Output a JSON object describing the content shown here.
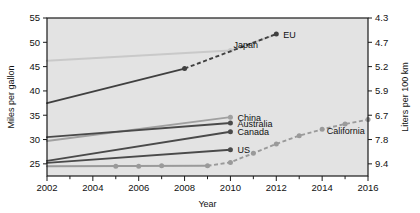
{
  "chart_data": {
    "type": "line",
    "title": "",
    "xlabel": "Year",
    "ylabel": "Miles per gallon",
    "y2label": "Liters per 100 km",
    "xlim": [
      2002,
      2016
    ],
    "ylim": [
      22.5,
      55
    ],
    "xticks": [
      2002,
      2003,
      2004,
      2005,
      2006,
      2007,
      2008,
      2009,
      2010,
      2011,
      2012,
      2013,
      2014,
      2015,
      2016
    ],
    "xticklabels": [
      "2002",
      "",
      "2004",
      "",
      "2006",
      "",
      "2008",
      "",
      "2010",
      "",
      "2012",
      "",
      "2014",
      "",
      "2016"
    ],
    "yticks": [
      25,
      30,
      35,
      40,
      45,
      50,
      55
    ],
    "yticklabels": [
      "25",
      "30",
      "35",
      "40",
      "45",
      "50",
      "55"
    ],
    "y2ticks": [
      25,
      30,
      35,
      40,
      45,
      50,
      55
    ],
    "y2ticklabels": [
      "9.4",
      "7.8",
      "6.7",
      "5.9",
      "5.2",
      "4.7",
      "4.3"
    ],
    "grid": false,
    "legend": "inline-end-labels",
    "plot_bgcolor": "#e3e3e3",
    "series": [
      {
        "name": "Japan",
        "color": "#c9c9c9",
        "label_anchor": "below-right",
        "solid": [
          {
            "x": 2002,
            "y": 46.2
          },
          {
            "x": 2010,
            "y": 48.3
          }
        ],
        "dashed": [
          {
            "x": 2010,
            "y": 48.3
          },
          {
            "x": 2012,
            "y": 51.6
          }
        ],
        "markers": [
          {
            "x": 2010,
            "y": 48.3
          }
        ]
      },
      {
        "name": "EU",
        "color": "#404040",
        "label_anchor": "right",
        "solid": [
          {
            "x": 2002,
            "y": 37.5
          },
          {
            "x": 2008,
            "y": 44.6
          }
        ],
        "dashed": [
          {
            "x": 2008,
            "y": 44.6
          },
          {
            "x": 2012,
            "y": 51.7
          }
        ],
        "markers": [
          {
            "x": 2008,
            "y": 44.6
          },
          {
            "x": 2012,
            "y": 51.7
          }
        ]
      },
      {
        "name": "China",
        "color": "#a0a0a0",
        "label_anchor": "right",
        "solid": [
          {
            "x": 2002,
            "y": 29.7
          },
          {
            "x": 2010,
            "y": 34.6
          }
        ],
        "dashed": [],
        "markers": [
          {
            "x": 2010,
            "y": 34.6
          }
        ]
      },
      {
        "name": "Australia",
        "color": "#4a4a4a",
        "label_anchor": "right",
        "solid": [
          {
            "x": 2002,
            "y": 30.5
          },
          {
            "x": 2010,
            "y": 33.4
          }
        ],
        "dashed": [],
        "markers": [
          {
            "x": 2010,
            "y": 33.4
          }
        ]
      },
      {
        "name": "Canada",
        "color": "#4a4a4a",
        "label_anchor": "right",
        "solid": [
          {
            "x": 2002,
            "y": 25.6
          },
          {
            "x": 2010,
            "y": 31.6
          }
        ],
        "dashed": [],
        "markers": [
          {
            "x": 2010,
            "y": 31.6
          }
        ]
      },
      {
        "name": "US",
        "color": "#4a4a4a",
        "label_anchor": "right",
        "solid": [
          {
            "x": 2002,
            "y": 25.2
          },
          {
            "x": 2010,
            "y": 27.9
          }
        ],
        "dashed": [],
        "markers": [
          {
            "x": 2010,
            "y": 27.9
          }
        ]
      },
      {
        "name": "California",
        "color": "#9a9a9a",
        "label_anchor": "below-right",
        "solid": [
          {
            "x": 2002,
            "y": 24.5
          },
          {
            "x": 2009,
            "y": 24.6
          }
        ],
        "dashed": [
          {
            "x": 2009,
            "y": 24.6
          },
          {
            "x": 2010,
            "y": 25.3
          },
          {
            "x": 2011,
            "y": 27.2
          },
          {
            "x": 2012,
            "y": 29.1
          },
          {
            "x": 2013,
            "y": 30.8
          },
          {
            "x": 2014,
            "y": 32.1
          },
          {
            "x": 2015,
            "y": 33.2
          },
          {
            "x": 2016,
            "y": 34.1
          }
        ],
        "markers": [
          {
            "x": 2005,
            "y": 24.5
          },
          {
            "x": 2006,
            "y": 24.5
          },
          {
            "x": 2007,
            "y": 24.6
          },
          {
            "x": 2009,
            "y": 24.6
          },
          {
            "x": 2010,
            "y": 25.3
          },
          {
            "x": 2011,
            "y": 27.2
          },
          {
            "x": 2012,
            "y": 29.1
          },
          {
            "x": 2013,
            "y": 30.8
          },
          {
            "x": 2014,
            "y": 32.1
          },
          {
            "x": 2015,
            "y": 33.2
          },
          {
            "x": 2016,
            "y": 34.1
          }
        ]
      }
    ],
    "annotations": [
      {
        "text": "EU",
        "x": 2012,
        "y": 51.7,
        "dx": 7,
        "dy": 3.5
      },
      {
        "text": "Japan",
        "x": 2010,
        "y": 48.3,
        "dx": 3,
        "dy": -2.2
      },
      {
        "text": "China",
        "x": 2010,
        "y": 34.6,
        "dx": 7,
        "dy": 3.5
      },
      {
        "text": "Australia",
        "x": 2010,
        "y": 33.4,
        "dx": 7,
        "dy": 3.5
      },
      {
        "text": "Canada",
        "x": 2010,
        "y": 31.6,
        "dx": 7,
        "dy": 3.5
      },
      {
        "text": "US",
        "x": 2010,
        "y": 27.9,
        "dx": 7,
        "dy": 3.5
      },
      {
        "text": "California",
        "x": 2013.9,
        "y": 30.8,
        "dx": 7,
        "dy": -1.6
      }
    ]
  }
}
